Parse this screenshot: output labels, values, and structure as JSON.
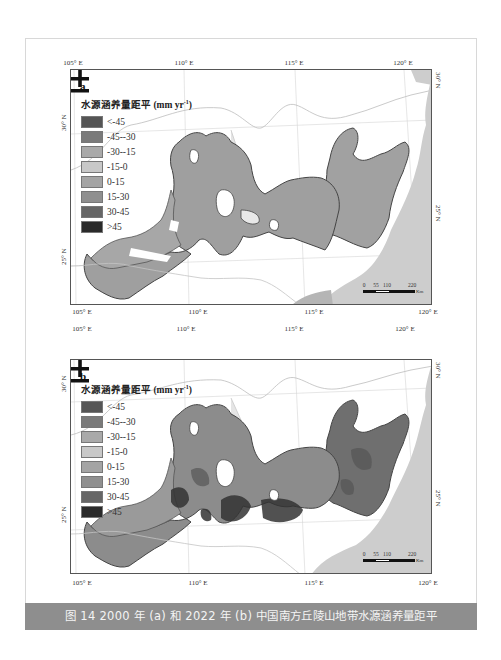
{
  "figure": {
    "caption": "图 14   2000 年 (a) 和 2022 年 (b) 中国南方丘陵山地带水源涵养量距平",
    "panels": [
      {
        "label": "a",
        "year": "2000",
        "lon_ticks_top": [
          "105° E",
          "110° E",
          "115° E",
          "120° E"
        ],
        "lon_ticks_bottom": [
          "105° E",
          "110° E",
          "115° E",
          "120° E"
        ],
        "lat_ticks_left": [
          "30° N",
          "25° N"
        ],
        "lat_ticks_right": [
          "30° N",
          "25° N"
        ]
      },
      {
        "label": "b",
        "year": "2022",
        "lon_ticks_top": [
          "105° E",
          "110° E",
          "115° E",
          "120° E"
        ],
        "lon_ticks_bottom": [
          "105° E",
          "110° E",
          "115° E",
          "120° E"
        ],
        "lat_ticks_left": [
          "30° N",
          "25° N"
        ],
        "lat_ticks_right": [
          "30° N",
          "25° N"
        ]
      }
    ],
    "legend": {
      "title": "水源涵养量距平 (mm yr",
      "title_sup": "-1",
      "title_end": ")",
      "items": [
        {
          "label": "<-45",
          "color": "#555555"
        },
        {
          "label": "-45--30",
          "color": "#7a7a7a"
        },
        {
          "label": "-30--15",
          "color": "#a9a9a9"
        },
        {
          "label": "-15-0",
          "color": "#c8c8c8"
        },
        {
          "label": "0-15",
          "color": "#a4a4a4"
        },
        {
          "label": "15-30",
          "color": "#8f8f8f"
        },
        {
          "label": "30-45",
          "color": "#666666"
        },
        {
          "label": ">45",
          "color": "#2a2a2a"
        }
      ]
    },
    "scale_bar": {
      "ticks": [
        "0",
        "55",
        "110",
        "220"
      ],
      "unit": "Km"
    },
    "north_arrow": "north-arrow-icon"
  }
}
